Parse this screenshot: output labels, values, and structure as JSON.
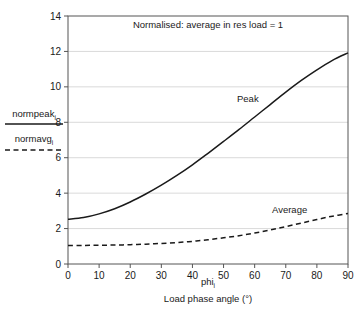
{
  "chart_data": {
    "type": "line",
    "title": "Normalised: average in res load = 1",
    "xlabel": "Load phase angle (°)",
    "xlabel_symbol": "phi",
    "xlabel_symbol_sub": "i",
    "ylabel_numerator": "normpeak",
    "ylabel_numerator_sub": "i",
    "ylabel_denominator": "normavg",
    "ylabel_denominator_sub": "i",
    "xlim": [
      0,
      90
    ],
    "ylim": [
      0,
      14
    ],
    "xticks": [
      0,
      10,
      20,
      30,
      40,
      50,
      60,
      70,
      80,
      90
    ],
    "yticks": [
      0,
      2,
      4,
      6,
      8,
      10,
      12,
      14
    ],
    "grid": "horizontal",
    "legend_position": "left-outside",
    "x": [
      0,
      5,
      10,
      15,
      20,
      25,
      30,
      35,
      40,
      45,
      50,
      55,
      60,
      65,
      70,
      75,
      80,
      85,
      90
    ],
    "series": [
      {
        "name": "Peak",
        "style": "solid",
        "label_position": "inside-upper-middle",
        "values": [
          2.52,
          2.62,
          2.83,
          3.12,
          3.5,
          3.95,
          4.45,
          5.0,
          5.6,
          6.25,
          6.92,
          7.6,
          8.3,
          9.0,
          9.7,
          10.36,
          10.96,
          11.5,
          11.92
        ]
      },
      {
        "name": "Average",
        "style": "dashed",
        "label_position": "inside-lower-right",
        "values": [
          1.05,
          1.05,
          1.06,
          1.07,
          1.09,
          1.12,
          1.16,
          1.21,
          1.28,
          1.37,
          1.48,
          1.6,
          1.75,
          1.92,
          2.11,
          2.31,
          2.51,
          2.7,
          2.85
        ]
      }
    ]
  }
}
